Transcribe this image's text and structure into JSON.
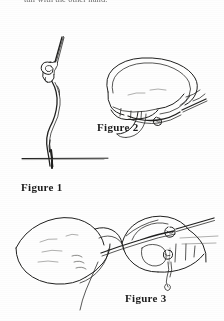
{
  "document": {
    "background_color": "#fefefe",
    "ink_color": "#20201f",
    "body_text_top": "tail with the other hand.",
    "figures": [
      {
        "id": "figure-1",
        "caption": "Figure 1",
        "subject": "needle and thread forming a knot above fabric line"
      },
      {
        "id": "figure-2",
        "caption": "Figure 2",
        "subject": "hand holding thread loop between fingers"
      },
      {
        "id": "figure-3",
        "caption": "Figure 3",
        "subject": "two hands pinching thread with needle at fingertip"
      }
    ]
  }
}
